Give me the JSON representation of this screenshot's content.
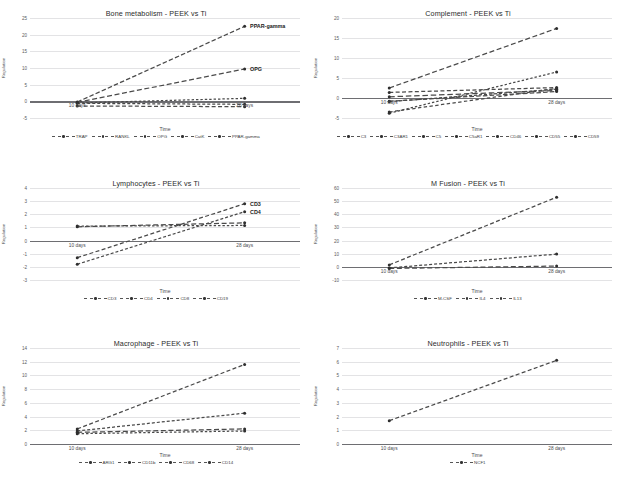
{
  "figure": {
    "axis_titles": {
      "x": "Time",
      "y": "Regulation"
    },
    "categories": [
      "10 days",
      "28 days"
    ]
  },
  "panels": [
    {
      "id": "bone-metabolism",
      "chart_data": {
        "type": "line",
        "title": "Bone metabolism - PEEK vs Ti",
        "xlabel": "Time",
        "ylabel": "Regulation",
        "categories": [
          "10 days",
          "28 days"
        ],
        "ylim": [
          -5,
          25
        ],
        "yticks": [
          -5,
          0,
          5,
          10,
          15,
          20,
          25
        ],
        "grid": true,
        "legend_position": "bottom",
        "series": [
          {
            "name": "TRAP",
            "values": [
              -1.4,
              -1.6
            ]
          },
          {
            "name": "RANKL",
            "values": [
              -0.6,
              -0.9
            ]
          },
          {
            "name": "OPG",
            "values": [
              -0.3,
              9.7
            ]
          },
          {
            "name": "CatK",
            "values": [
              -0.5,
              0.9
            ]
          },
          {
            "name": "PPAR-gamma",
            "values": [
              -0.2,
              22.5
            ]
          }
        ],
        "annotations": [
          {
            "text": "PPAR-gamma",
            "series": "PPAR-gamma",
            "at": "28 days"
          },
          {
            "text": "OPG",
            "series": "OPG",
            "at": "28 days"
          }
        ]
      }
    },
    {
      "id": "complement",
      "chart_data": {
        "type": "line",
        "title": "Complement - PEEK vs Ti",
        "xlabel": "Time",
        "ylabel": "Regulation",
        "categories": [
          "10 days",
          "28 days"
        ],
        "ylim": [
          -5,
          20
        ],
        "yticks": [
          -5,
          0,
          5,
          10,
          15,
          20
        ],
        "grid": true,
        "legend_position": "bottom",
        "series": [
          {
            "name": "C3",
            "values": [
              1.4,
              2.6
            ]
          },
          {
            "name": "C3AR1",
            "values": [
              -0.9,
              2.2
            ]
          },
          {
            "name": "C5",
            "values": [
              2.5,
              17.4
            ]
          },
          {
            "name": "C5aR1",
            "values": [
              -3.8,
              6.5
            ]
          },
          {
            "name": "CD46",
            "values": [
              -0.8,
              1.6
            ]
          },
          {
            "name": "CD55",
            "values": [
              -3.5,
              2.4
            ]
          },
          {
            "name": "CD59",
            "values": [
              0.3,
              1.9
            ]
          }
        ]
      }
    },
    {
      "id": "lymphocytes",
      "chart_data": {
        "type": "line",
        "title": "Lymphocytes - PEEK vs Ti",
        "xlabel": "Time",
        "ylabel": "Regulation",
        "categories": [
          "10 days",
          "28 days"
        ],
        "ylim": [
          -3,
          4
        ],
        "yticks": [
          -3,
          -2,
          -1,
          0,
          1,
          2,
          3,
          4
        ],
        "grid": true,
        "legend_position": "bottom",
        "series": [
          {
            "name": "CD3",
            "values": [
              -1.3,
              2.8
            ]
          },
          {
            "name": "CD4",
            "values": [
              -1.8,
              2.2
            ]
          },
          {
            "name": "CD8",
            "values": [
              1.05,
              1.35
            ]
          },
          {
            "name": "CD19",
            "values": [
              1.1,
              1.15
            ]
          }
        ],
        "annotations": [
          {
            "text": "CD3",
            "series": "CD3",
            "at": "28 days"
          },
          {
            "text": "CD4",
            "series": "CD4",
            "at": "28 days"
          }
        ]
      }
    },
    {
      "id": "m-fusion",
      "chart_data": {
        "type": "line",
        "title": "M Fusion - PEEK vs Ti",
        "xlabel": "Time",
        "ylabel": "Regulation",
        "categories": [
          "10 days",
          "28 days"
        ],
        "ylim": [
          -10,
          60
        ],
        "yticks": [
          -10,
          0,
          10,
          20,
          30,
          40,
          50,
          60
        ],
        "grid": true,
        "legend_position": "bottom",
        "series": [
          {
            "name": "M-CSF",
            "values": [
              1.5,
              53.0
            ]
          },
          {
            "name": "IL4",
            "values": [
              -0.8,
              9.7
            ]
          },
          {
            "name": "IL13",
            "values": [
              -1.2,
              0.6
            ]
          }
        ]
      }
    },
    {
      "id": "macrophage",
      "chart_data": {
        "type": "line",
        "title": "Macrophage - PEEK vs Ti",
        "xlabel": "Time",
        "ylabel": "Regulation",
        "categories": [
          "10 days",
          "28 days"
        ],
        "ylim": [
          0,
          14
        ],
        "yticks": [
          0,
          2,
          4,
          6,
          8,
          10,
          12,
          14
        ],
        "grid": true,
        "legend_position": "bottom",
        "series": [
          {
            "name": "ARG1",
            "values": [
              2.2,
              11.6
            ]
          },
          {
            "name": "CD11b",
            "values": [
              1.9,
              4.5
            ]
          },
          {
            "name": "CD68",
            "values": [
              1.7,
              2.2
            ]
          },
          {
            "name": "CD14",
            "values": [
              1.5,
              1.9
            ]
          }
        ]
      }
    },
    {
      "id": "neutrophils",
      "chart_data": {
        "type": "line",
        "title": "Neutrophils - PEEK vs Ti",
        "xlabel": "Time",
        "ylabel": "Regulation",
        "categories": [
          "10 days",
          "28 days"
        ],
        "ylim": [
          0,
          7
        ],
        "yticks": [
          0,
          1,
          2,
          3,
          4,
          5,
          6,
          7
        ],
        "grid": true,
        "legend_position": "bottom",
        "series": [
          {
            "name": "NCF1",
            "values": [
              1.7,
              6.1
            ]
          }
        ]
      }
    }
  ]
}
